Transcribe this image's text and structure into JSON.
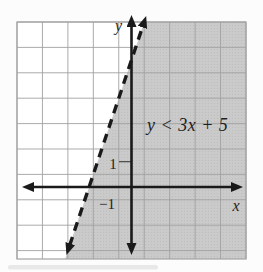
{
  "figure": {
    "labels": {
      "inequality": "y < 3x + 5",
      "x_axis": "x",
      "y_axis": "y",
      "y_tick": "1",
      "x_tick": "−1"
    },
    "colors": {
      "page_bg": "#fcfcfc",
      "figure_bg": "#ffffff",
      "shading": "#cacaca",
      "dot": "#bcbcbc",
      "grid": "#a2a2a2",
      "axis": "#1a1a1a",
      "text": "#1f1f1f"
    }
  },
  "chart_data": {
    "type": "line",
    "subtype": "linear-inequality-graph",
    "title": "",
    "inequality": "y < 3x + 5",
    "boundary_line": {
      "equation": "y = 3x + 5",
      "slope": 3,
      "y_intercept": 5,
      "x_intercept": -1.67,
      "style": "dashed",
      "arrows_both_ends": true
    },
    "shaded_region": "region below/right of the dashed boundary line where y < 3x + 5",
    "xlabel": "x",
    "ylabel": "y",
    "xlim": [
      -4.5,
      4.5
    ],
    "ylim": [
      -2.9,
      6.6
    ],
    "grid": true,
    "grid_spacing": 1,
    "x_tick_labels": [
      {
        "value": -1,
        "label": "−1"
      }
    ],
    "y_tick_labels": [
      {
        "value": 1,
        "label": "1"
      }
    ],
    "legend": false
  }
}
